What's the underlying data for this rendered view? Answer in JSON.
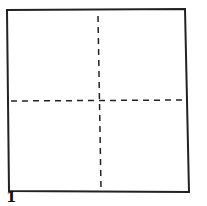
{
  "diagram": {
    "step_number": "1",
    "shapes": [
      {
        "type": "square",
        "label": "paper-square",
        "stroke": "#222222"
      },
      {
        "type": "dashed-line",
        "orientation": "vertical",
        "label": "vertical-fold-line"
      },
      {
        "type": "dashed-line",
        "orientation": "horizontal",
        "label": "horizontal-fold-line"
      }
    ],
    "colors": {
      "stroke": "#222222",
      "background": "#ffffff"
    }
  }
}
